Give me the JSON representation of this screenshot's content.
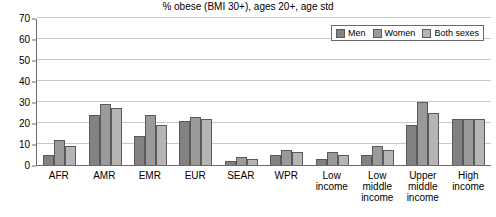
{
  "chart_data": {
    "type": "bar",
    "title": "% obese (BMI 30+), ages 20+, age std",
    "xlabel": "",
    "ylabel": "",
    "ylim": [
      0,
      70
    ],
    "yticks": [
      0,
      10,
      20,
      30,
      40,
      50,
      60,
      70
    ],
    "grid": true,
    "legend_position": "top-right",
    "categories": [
      "AFR",
      "AMR",
      "EMR",
      "EUR",
      "SEAR",
      "WPR",
      "Low income",
      "Low middle income",
      "Upper middle income",
      "High income"
    ],
    "series": [
      {
        "name": "Men",
        "color": "#828282",
        "values": [
          5,
          24,
          14,
          21,
          2,
          5,
          3,
          5,
          19,
          22
        ]
      },
      {
        "name": "Women",
        "color": "#9a9a9a",
        "values": [
          12,
          29,
          24,
          23,
          4,
          7,
          6,
          9,
          30,
          22
        ]
      },
      {
        "name": "Both sexes",
        "color": "#b5b5b5",
        "values": [
          9,
          27,
          19,
          22,
          3,
          6,
          5,
          7,
          25,
          22
        ]
      }
    ]
  },
  "axis": {
    "y_tick_labels": [
      "0",
      "10",
      "20",
      "30",
      "40",
      "50",
      "60",
      "70"
    ]
  },
  "colors": {
    "men": "#828282",
    "women": "#9a9a9a",
    "both": "#b5b5b5",
    "axis": "#6b6b6b",
    "grid": "#c9c9c9",
    "bar_outline": "#5a5a5a",
    "background": "#ffffff"
  }
}
